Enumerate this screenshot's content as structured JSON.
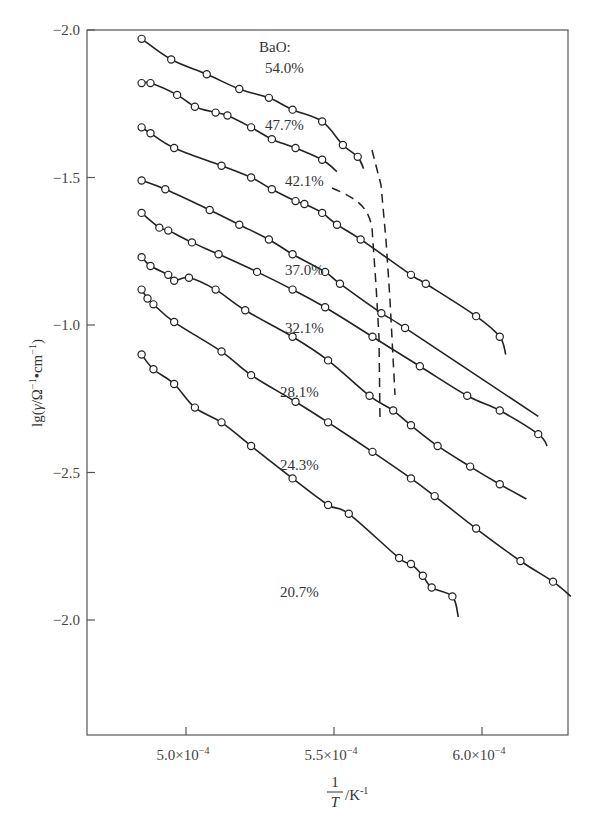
{
  "chart_data": {
    "type": "scatter",
    "title": "",
    "legend_title": "BaO:",
    "xlabel": "1/T /K^-1",
    "xlabel_parts": {
      "numerator": "1",
      "denominator": "T",
      "unit": "/K",
      "unit_exp": "-1"
    },
    "ylabel": "lg(γ/Ω⁻¹·cm⁻¹)",
    "x_ticks": [
      {
        "value": 0.0005,
        "label": "5.0×10",
        "exp": "-4"
      },
      {
        "value": 0.00055,
        "label": "5.5×10",
        "exp": "-4"
      },
      {
        "value": 0.0006,
        "label": "6.0×10",
        "exp": "-4"
      }
    ],
    "y_ticks_printed": [
      "-2.0",
      "-1.5",
      "-1.0",
      "-2.5",
      "-2.0"
    ],
    "y_ticks_note": "tick labels reproduced as printed; data y below uses a linear scale where the top tick is 0 and each tick step is 0.5 (downward positive offset)",
    "xlim": [
      0.000489,
      0.00063
    ],
    "ylim_offset": [
      0,
      2.4
    ],
    "grid": false,
    "series": [
      {
        "name": "54.0%",
        "label_pos": [
          265,
          73
        ],
        "x": [
          0.000485,
          0.000495,
          0.000507,
          0.000518,
          0.000528,
          0.000536,
          0.000546,
          0.000553,
          0.000558
        ],
        "y": [
          0.03,
          0.1,
          0.15,
          0.2,
          0.23,
          0.27,
          0.31,
          0.39,
          0.43
        ],
        "fit_end": [
          0.00056,
          0.47
        ],
        "curve": "bends"
      },
      {
        "name": "47.7%",
        "label_pos": [
          265,
          130
        ],
        "x": [
          0.000485,
          0.000488,
          0.000497,
          0.000503,
          0.00051,
          0.000514,
          0.000522,
          0.000529,
          0.000537,
          0.000546
        ],
        "y": [
          0.18,
          0.18,
          0.22,
          0.26,
          0.28,
          0.29,
          0.33,
          0.37,
          0.4,
          0.44
        ],
        "fit_end": [
          0.000551,
          0.48
        ],
        "curve": "dashed-tail"
      },
      {
        "name": "42.1%",
        "label_pos": [
          285,
          186
        ],
        "x": [
          0.000485,
          0.000488,
          0.000496,
          0.000512,
          0.000522,
          0.000529,
          0.000537,
          0.00054,
          0.000546,
          0.000551,
          0.000559,
          0.000576,
          0.000581,
          0.000598,
          0.000606
        ],
        "y": [
          0.33,
          0.35,
          0.4,
          0.46,
          0.5,
          0.54,
          0.58,
          0.59,
          0.62,
          0.66,
          0.71,
          0.83,
          0.86,
          0.97,
          1.04
        ],
        "fit_end": [
          0.000608,
          1.1
        ],
        "curve": "bends"
      },
      {
        "name": "37.0%",
        "label_pos": [
          285,
          275
        ],
        "x": [
          0.000485,
          0.000493,
          0.000508,
          0.000518,
          0.000528,
          0.000536,
          0.000547,
          0.000552,
          0.000566,
          0.000574
        ],
        "y": [
          0.51,
          0.54,
          0.61,
          0.66,
          0.71,
          0.76,
          0.82,
          0.86,
          0.96,
          1.01
        ],
        "fit_end": [
          0.000619,
          1.31
        ],
        "curve": "straight"
      },
      {
        "name": "32.1%",
        "label_pos": [
          285,
          333
        ],
        "x": [
          0.000485,
          0.000491,
          0.000494,
          0.000502,
          0.000511,
          0.000524,
          0.000536,
          0.000547,
          0.000563,
          0.000579,
          0.000595,
          0.000606,
          0.000619
        ],
        "y": [
          0.62,
          0.67,
          0.68,
          0.72,
          0.76,
          0.82,
          0.88,
          0.94,
          1.04,
          1.14,
          1.24,
          1.29,
          1.37
        ],
        "fit_end": [
          0.000622,
          1.41
        ],
        "curve": "straight"
      },
      {
        "name": "28.1%",
        "label_pos": [
          280,
          397
        ],
        "x": [
          0.000485,
          0.000488,
          0.000494,
          0.000496,
          0.000501,
          0.00051,
          0.00052,
          0.000536,
          0.000548,
          0.000562,
          0.00057,
          0.000576,
          0.000585,
          0.000596,
          0.000606
        ],
        "y": [
          0.77,
          0.8,
          0.83,
          0.85,
          0.84,
          0.88,
          0.95,
          1.04,
          1.12,
          1.24,
          1.29,
          1.34,
          1.41,
          1.48,
          1.54
        ],
        "fit_end": [
          0.000615,
          1.59
        ],
        "curve": "straight"
      },
      {
        "name": "24.3%",
        "label_pos": [
          280,
          470
        ],
        "x": [
          0.000485,
          0.000487,
          0.000489,
          0.000496,
          0.000512,
          0.000522,
          0.000537,
          0.000548,
          0.000563,
          0.000576,
          0.000584,
          0.000598,
          0.000613,
          0.000624
        ],
        "y": [
          0.88,
          0.91,
          0.93,
          0.99,
          1.09,
          1.17,
          1.26,
          1.33,
          1.43,
          1.52,
          1.58,
          1.69,
          1.8,
          1.87
        ],
        "fit_end": [
          0.00063,
          1.92
        ],
        "curve": "straight"
      },
      {
        "name": "20.7%",
        "label_pos": [
          280,
          597
        ],
        "x": [
          0.000485,
          0.000489,
          0.000496,
          0.000503,
          0.000512,
          0.000522,
          0.000536,
          0.000548,
          0.000555,
          0.000572,
          0.000576,
          0.00058,
          0.000583,
          0.00059
        ],
        "y": [
          1.1,
          1.15,
          1.2,
          1.28,
          1.33,
          1.41,
          1.52,
          1.61,
          1.64,
          1.79,
          1.81,
          1.85,
          1.89,
          1.92
        ],
        "fit_end": [
          0.000592,
          1.99
        ],
        "curve": "straight"
      }
    ]
  }
}
